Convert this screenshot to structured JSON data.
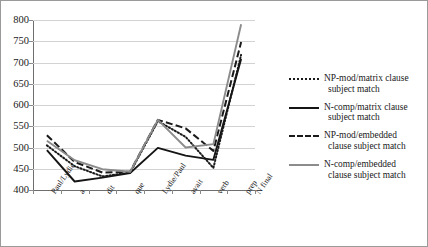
{
  "chart_data": {
    "type": "line",
    "title": "",
    "xlabel": "",
    "ylabel": "",
    "ylim": [
      400,
      800
    ],
    "ytick_step": 50,
    "yticks": [
      400,
      450,
      500,
      550,
      600,
      650,
      700,
      750,
      800
    ],
    "grid": true,
    "legend_position": "right",
    "categories": [
      "Paul/Lydie",
      "a",
      "dit",
      "que",
      "Lydie/Paul",
      "avait",
      "verb",
      "prep N final"
    ],
    "series": [
      {
        "name": "NP-mod/matrix clause subject match",
        "style": "dotted",
        "color": "#1a1a1a",
        "values": [
          505,
          456,
          432,
          441,
          562,
          525,
          452,
          718
        ]
      },
      {
        "name": "N-comp/matrix clause subject match",
        "style": "solid",
        "color": "#151515",
        "values": [
          494,
          420,
          429,
          440,
          499,
          481,
          471,
          708
        ]
      },
      {
        "name": "NP-mod/embedded clause subject match",
        "style": "dashed",
        "color": "#1a1a1a",
        "values": [
          529,
          466,
          441,
          443,
          565,
          545,
          492,
          748
        ]
      },
      {
        "name": "N-comp/embedded clause subject match",
        "style": "solid-gray",
        "color": "#8c8c8c",
        "values": [
          516,
          470,
          449,
          443,
          565,
          500,
          508,
          790
        ]
      }
    ]
  },
  "legend": {
    "items": [
      {
        "label_line1": "NP-mod/matrix clause",
        "label_line2": "subject match",
        "key": "dotted"
      },
      {
        "label_line1": "N-comp/matrix clause",
        "label_line2": "subject match",
        "key": "solid"
      },
      {
        "label_line1": "NP-mod/embedded",
        "label_line2": "clause subject match",
        "key": "dashed"
      },
      {
        "label_line1": "N-comp/embedded",
        "label_line2": "clause subject match",
        "key": "solid-gray"
      }
    ]
  },
  "xaxis": {
    "labels": [
      {
        "line1": "Paul/Lydie",
        "line2": ""
      },
      {
        "line1": "a",
        "line2": ""
      },
      {
        "line1": "dit",
        "line2": ""
      },
      {
        "line1": "que",
        "line2": ""
      },
      {
        "line1": "Lydie/Paul",
        "line2": ""
      },
      {
        "line1": "avait",
        "line2": ""
      },
      {
        "line1": "verb",
        "line2": ""
      },
      {
        "line1": "prep",
        "line2": "N final"
      }
    ]
  },
  "yaxis": {
    "labels": [
      "800",
      "750",
      "700",
      "650",
      "600",
      "550",
      "500",
      "450",
      "400"
    ]
  }
}
